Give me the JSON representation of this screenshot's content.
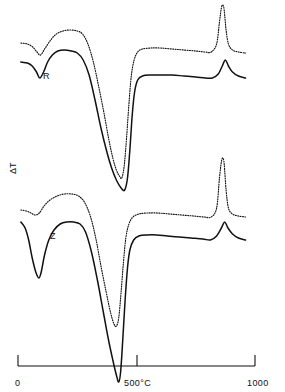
{
  "chart_data": {
    "type": "line",
    "title": "",
    "xlabel": "",
    "ylabel": "ΔT",
    "xlim": [
      0,
      1100
    ],
    "ylim": [
      0,
      1
    ],
    "grid": false,
    "legend": "inline-curve-labels",
    "x_ticks": [
      {
        "value": 0,
        "label": "0"
      },
      {
        "value": 500,
        "label": "500°C"
      },
      {
        "value": 1000,
        "label": "1000"
      }
    ],
    "y_ticks": [],
    "annotations": [
      {
        "text": "R",
        "x": 90,
        "y_group": "upper",
        "note": "upper curve pair label"
      },
      {
        "text": "Z",
        "x": 150,
        "y_group": "lower",
        "note": "lower curve pair label"
      }
    ],
    "series": [
      {
        "name": "R-solid",
        "group": "R",
        "style": "solid",
        "color": "#111111",
        "points": [
          [
            12,
            62
          ],
          [
            40,
            63
          ],
          [
            60,
            66
          ],
          [
            78,
            72
          ],
          [
            92,
            78
          ],
          [
            108,
            72
          ],
          [
            125,
            62
          ],
          [
            145,
            55
          ],
          [
            168,
            51
          ],
          [
            195,
            50
          ],
          [
            225,
            51
          ],
          [
            250,
            53
          ],
          [
            275,
            60
          ],
          [
            300,
            75
          ],
          [
            325,
            100
          ],
          [
            350,
            128
          ],
          [
            375,
            152
          ],
          [
            395,
            168
          ],
          [
            415,
            180
          ],
          [
            435,
            188
          ],
          [
            450,
            190
          ],
          [
            462,
            178
          ],
          [
            472,
            150
          ],
          [
            482,
            115
          ],
          [
            492,
            92
          ],
          [
            505,
            80
          ],
          [
            525,
            76
          ],
          [
            560,
            75
          ],
          [
            600,
            75
          ],
          [
            650,
            75
          ],
          [
            700,
            76
          ],
          [
            750,
            77
          ],
          [
            790,
            78
          ],
          [
            820,
            78
          ],
          [
            845,
            74
          ],
          [
            862,
            66
          ],
          [
            875,
            60
          ],
          [
            888,
            66
          ],
          [
            905,
            72
          ],
          [
            930,
            76
          ],
          [
            960,
            78
          ]
        ]
      },
      {
        "name": "R-dotted",
        "group": "R",
        "style": "dotted",
        "color": "#111111",
        "points": [
          [
            12,
            43
          ],
          [
            40,
            44
          ],
          [
            62,
            47
          ],
          [
            80,
            52
          ],
          [
            95,
            55
          ],
          [
            115,
            48
          ],
          [
            138,
            40
          ],
          [
            162,
            34
          ],
          [
            190,
            31
          ],
          [
            220,
            30
          ],
          [
            250,
            31
          ],
          [
            272,
            34
          ],
          [
            295,
            44
          ],
          [
            318,
            62
          ],
          [
            340,
            86
          ],
          [
            362,
            112
          ],
          [
            382,
            138
          ],
          [
            400,
            158
          ],
          [
            415,
            170
          ],
          [
            428,
            176
          ],
          [
            438,
            178
          ],
          [
            448,
            166
          ],
          [
            458,
            138
          ],
          [
            468,
            104
          ],
          [
            478,
            76
          ],
          [
            490,
            60
          ],
          [
            505,
            52
          ],
          [
            525,
            49
          ],
          [
            560,
            48
          ],
          [
            600,
            48
          ],
          [
            650,
            49
          ],
          [
            700,
            50
          ],
          [
            750,
            51
          ],
          [
            790,
            52
          ],
          [
            815,
            52
          ],
          [
            838,
            44
          ],
          [
            850,
            22
          ],
          [
            858,
            8
          ],
          [
            864,
            5
          ],
          [
            870,
            10
          ],
          [
            878,
            30
          ],
          [
            888,
            44
          ],
          [
            905,
            50
          ],
          [
            930,
            52
          ],
          [
            960,
            53
          ]
        ]
      },
      {
        "name": "Z-solid",
        "group": "Z",
        "style": "solid",
        "color": "#111111",
        "points": [
          [
            12,
            222
          ],
          [
            30,
            228
          ],
          [
            45,
            240
          ],
          [
            60,
            258
          ],
          [
            75,
            272
          ],
          [
            88,
            278
          ],
          [
            98,
            272
          ],
          [
            112,
            255
          ],
          [
            130,
            240
          ],
          [
            152,
            230
          ],
          [
            178,
            224
          ],
          [
            205,
            222
          ],
          [
            235,
            222
          ],
          [
            262,
            224
          ],
          [
            285,
            232
          ],
          [
            310,
            252
          ],
          [
            335,
            280
          ],
          [
            360,
            312
          ],
          [
            382,
            340
          ],
          [
            400,
            360
          ],
          [
            415,
            375
          ],
          [
            425,
            382
          ],
          [
            433,
            372
          ],
          [
            442,
            340
          ],
          [
            452,
            300
          ],
          [
            462,
            268
          ],
          [
            472,
            250
          ],
          [
            488,
            240
          ],
          [
            510,
            236
          ],
          [
            545,
            235
          ],
          [
            585,
            235
          ],
          [
            630,
            236
          ],
          [
            680,
            237
          ],
          [
            730,
            238
          ],
          [
            780,
            239
          ],
          [
            812,
            240
          ],
          [
            838,
            236
          ],
          [
            858,
            228
          ],
          [
            872,
            222
          ],
          [
            886,
            228
          ],
          [
            905,
            234
          ],
          [
            930,
            238
          ],
          [
            960,
            240
          ]
        ]
      },
      {
        "name": "Z-dotted",
        "group": "Z",
        "style": "dotted",
        "color": "#111111",
        "points": [
          [
            12,
            210
          ],
          [
            35,
            211
          ],
          [
            55,
            213
          ],
          [
            72,
            215
          ],
          [
            90,
            213
          ],
          [
            110,
            206
          ],
          [
            135,
            200
          ],
          [
            165,
            196
          ],
          [
            195,
            194
          ],
          [
            228,
            194
          ],
          [
            255,
            196
          ],
          [
            280,
            202
          ],
          [
            305,
            216
          ],
          [
            328,
            238
          ],
          [
            350,
            266
          ],
          [
            372,
            292
          ],
          [
            390,
            312
          ],
          [
            405,
            324
          ],
          [
            415,
            326
          ],
          [
            425,
            318
          ],
          [
            435,
            292
          ],
          [
            445,
            262
          ],
          [
            455,
            238
          ],
          [
            468,
            224
          ],
          [
            485,
            217
          ],
          [
            510,
            214
          ],
          [
            545,
            213
          ],
          [
            590,
            213
          ],
          [
            640,
            214
          ],
          [
            690,
            215
          ],
          [
            740,
            216
          ],
          [
            785,
            217
          ],
          [
            815,
            217
          ],
          [
            838,
            208
          ],
          [
            850,
            178
          ],
          [
            858,
            162
          ],
          [
            864,
            158
          ],
          [
            870,
            164
          ],
          [
            878,
            190
          ],
          [
            888,
            208
          ],
          [
            905,
            214
          ],
          [
            930,
            216
          ],
          [
            960,
            217
          ]
        ]
      }
    ]
  },
  "axis": {
    "ticks": [
      {
        "id": "tick-0",
        "label": "0"
      },
      {
        "id": "tick-500",
        "label": "500°C"
      },
      {
        "id": "tick-1000",
        "label": "1000"
      }
    ],
    "y_axis_label": "ΔT"
  },
  "curve_labels": [
    {
      "id": "label-R",
      "text": "R"
    },
    {
      "id": "label-Z",
      "text": "Z"
    }
  ],
  "colors": {
    "ink": "#111111",
    "background": "#ffffff"
  }
}
